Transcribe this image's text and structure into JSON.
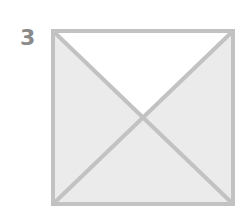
{
  "figure": {
    "number_label": "3",
    "shape": "square divided by both diagonals into four triangles",
    "triangles": [
      {
        "position": "top",
        "filled": false
      },
      {
        "position": "right",
        "filled": true
      },
      {
        "position": "bottom",
        "filled": true
      },
      {
        "position": "left",
        "filled": true
      }
    ],
    "colors": {
      "fill": "#ebebeb",
      "empty": "#ffffff",
      "stroke": "#c2c2c2",
      "label": "#8a8a8a"
    }
  }
}
